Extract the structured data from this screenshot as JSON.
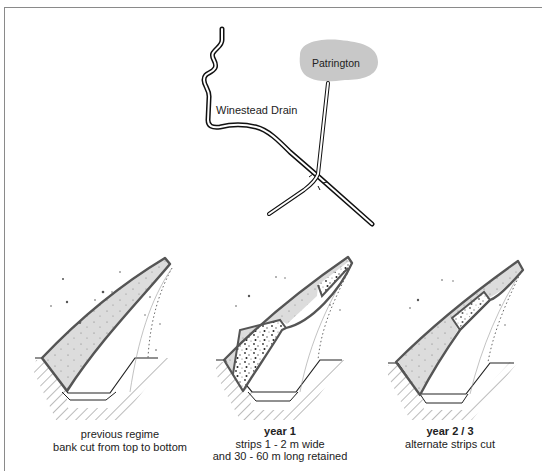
{
  "map": {
    "river_label": "Winestead Drain",
    "town_label": "Patrington",
    "town_fill": "#c8c8c8"
  },
  "diagrams": [
    {
      "title": "",
      "lines": [
        "previous regime",
        "bank cut from top to bottom"
      ]
    },
    {
      "title": "year 1",
      "lines": [
        "strips 1 - 2 m wide",
        "and 30 - 60 m long retained"
      ]
    },
    {
      "title": "year 2 / 3",
      "lines": [
        "alternate strips cut"
      ]
    }
  ],
  "colors": {
    "frame": "#8a8a8a",
    "bank_outline": "#555555",
    "cut_fill": "#dcdcdc",
    "retained_speckle": "#333333"
  }
}
